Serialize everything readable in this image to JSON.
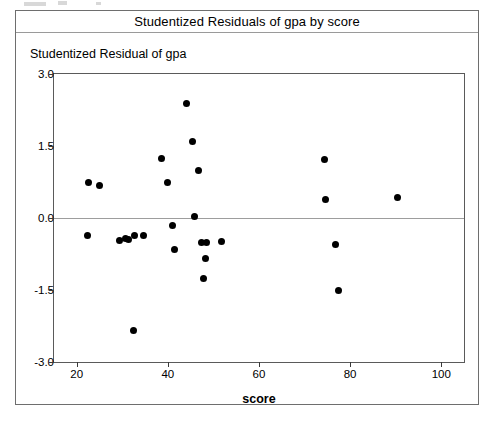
{
  "chart_panel": {
    "title": "Studentized Residuals of gpa by score"
  },
  "chart_data": {
    "type": "scatter",
    "title": "Studentized Residuals of gpa by score",
    "xlabel": "score",
    "ylabel": "Studentized Residual of gpa",
    "xlim": [
      15,
      105
    ],
    "ylim": [
      -3.0,
      3.0
    ],
    "xticks": [
      20,
      40,
      60,
      80,
      100
    ],
    "xtick_labels": [
      "20",
      "40",
      "60",
      "80",
      "100"
    ],
    "yticks": [
      3.0,
      1.5,
      0.0,
      -1.5,
      -3.0
    ],
    "ytick_labels": [
      "3.0",
      "1.5",
      "0.0",
      "-1.5",
      "-3.0"
    ],
    "grid": false,
    "legend": null,
    "reference_lines": [
      {
        "axis": "y",
        "value": 0.0,
        "color": "#9d9d9d"
      }
    ],
    "marker": {
      "shape": "circle",
      "color": "#000000",
      "size": 7
    },
    "points": [
      {
        "x": 22.6,
        "y": 0.75
      },
      {
        "x": 22.4,
        "y": -0.37
      },
      {
        "x": 25.0,
        "y": 0.68
      },
      {
        "x": 29.3,
        "y": -0.47
      },
      {
        "x": 30.6,
        "y": -0.42
      },
      {
        "x": 31.3,
        "y": -0.44
      },
      {
        "x": 32.6,
        "y": -0.36
      },
      {
        "x": 32.4,
        "y": -2.35
      },
      {
        "x": 34.6,
        "y": -0.37
      },
      {
        "x": 38.5,
        "y": 1.24
      },
      {
        "x": 40.0,
        "y": 0.74
      },
      {
        "x": 41.1,
        "y": -0.16
      },
      {
        "x": 41.5,
        "y": -0.66
      },
      {
        "x": 44.1,
        "y": 2.38
      },
      {
        "x": 45.4,
        "y": 1.6
      },
      {
        "x": 45.9,
        "y": 0.03
      },
      {
        "x": 46.7,
        "y": 1.0
      },
      {
        "x": 47.4,
        "y": -0.52
      },
      {
        "x": 48.5,
        "y": -0.5
      },
      {
        "x": 47.8,
        "y": -1.25
      },
      {
        "x": 48.2,
        "y": -0.84
      },
      {
        "x": 51.7,
        "y": -0.48
      },
      {
        "x": 74.3,
        "y": 1.22
      },
      {
        "x": 74.6,
        "y": 0.38
      },
      {
        "x": 76.7,
        "y": -0.55
      },
      {
        "x": 77.4,
        "y": -1.52
      },
      {
        "x": 90.4,
        "y": 0.42
      }
    ]
  }
}
